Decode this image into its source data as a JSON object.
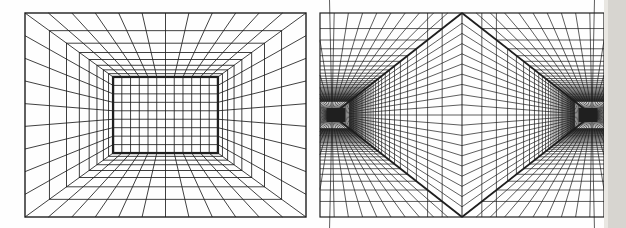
{
  "figure": {
    "width": 626,
    "height": 228,
    "background": "#fefefe",
    "line_color": "#1f1f1f",
    "page_edge_strip": {
      "x": 608,
      "width": 18,
      "color": "#d7d5d0",
      "soft_color": "#e9e7e2"
    },
    "one_point_panel": {
      "rect": {
        "x0": 25,
        "y0": 13,
        "x1": 306,
        "y1": 217
      },
      "depth_coeff": 0.21,
      "num_transversals": 7,
      "back_wall_depth_index": 8,
      "back_wall_cols": 12,
      "back_wall_rows": 9,
      "stroke": 0.85,
      "border_stroke": 1.4,
      "back_wall_stroke": 2.3
    },
    "two_point_panel": {
      "rect": {
        "x0": 320,
        "y0": 13,
        "x1": 604,
        "y1": 217
      },
      "vp_inset": 12,
      "depth_coeff": 0.18,
      "num_frames": 36,
      "full_height_frames": 2,
      "wall_ray_divisions": 20,
      "ceiling_ray_divisions": 10,
      "blob": {
        "w": 19,
        "h": 14,
        "offset": 4
      },
      "stroke": 0.72,
      "border_stroke": 1.2,
      "heavy_stroke": 1.8,
      "center_stroke": 0.95
    }
  }
}
